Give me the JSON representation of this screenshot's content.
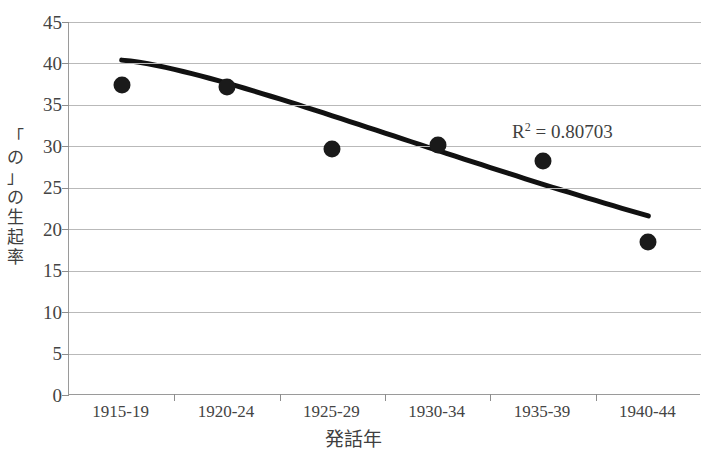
{
  "chart_data": {
    "type": "scatter",
    "title": "",
    "xlabel": "発話年",
    "ylabel": "「の」の生起率",
    "categories": [
      "1915-19",
      "1920-24",
      "1925-29",
      "1930-34",
      "1935-39",
      "1940-44"
    ],
    "values": [
      37.4,
      37.2,
      29.7,
      30.2,
      28.2,
      18.4
    ],
    "series": [
      {
        "name": "「の」の生起率",
        "values": [
          37.4,
          37.2,
          29.7,
          30.2,
          28.2,
          18.4
        ]
      }
    ],
    "ylim": [
      0,
      45
    ],
    "yticks": [
      0,
      5,
      10,
      15,
      20,
      25,
      30,
      35,
      40,
      45
    ],
    "ytick_labels": [
      "0",
      "5",
      "10",
      "15",
      "20",
      "25",
      "30",
      "35",
      "40",
      "45"
    ],
    "grid": true,
    "legend": "none",
    "trendline": {
      "type": "power",
      "start_value": 40.4,
      "end_value": 21.6,
      "r_squared": 0.80703,
      "annotation": "R² = 0.80703"
    },
    "annotations": [
      {
        "text": "R² = 0.80703",
        "value": 0.80703
      }
    ],
    "colors": {
      "marker": "#1a1a1a",
      "trendline": "#111111",
      "grid": "#b9b9b9",
      "axis": "#8d8d8d",
      "text": "#3f3f3f",
      "background": "#ffffff"
    }
  },
  "r2_label": {
    "prefix": "R",
    "sup": "2",
    "rest": " = 0.80703"
  },
  "axis_title_y_chars": [
    "「",
    "の",
    "」",
    "の",
    "生",
    "起",
    "率"
  ]
}
